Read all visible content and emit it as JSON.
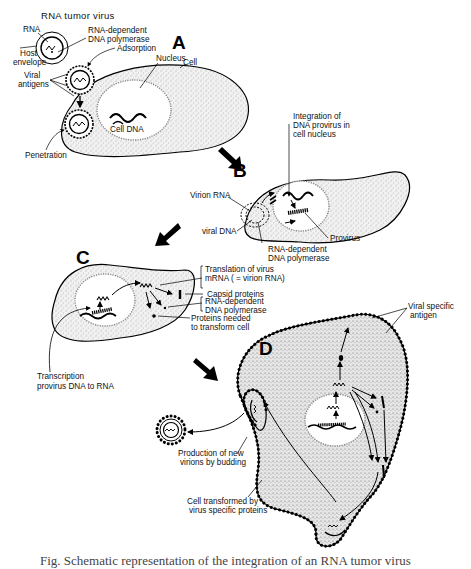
{
  "figure": {
    "panels": {
      "A": {
        "letter": "A",
        "virus_title": "RNA tumor virus",
        "labels": {
          "rna": "RNA",
          "polymerase_1": "RNA-dependent",
          "polymerase_2": "DNA polymerase",
          "host_1": "Host",
          "host_2": "envelope",
          "adsorption": "Adsorption",
          "nucleus": "Nucleus",
          "cell": "Cell",
          "antigens_1": "Viral",
          "antigens_2": "antigens",
          "cell_dna": "Cell DNA",
          "penetration": "Penetration"
        }
      },
      "B": {
        "letter": "B",
        "labels": {
          "integration_1": "Integration of",
          "integration_2": "DNA provirus in",
          "integration_3": "cell nucleus",
          "virion_rna": "Virion RNA",
          "viral_dna": "viral DNA",
          "provirus": "Provirus",
          "polymerase_1": "RNA-dependent",
          "polymerase_2": "DNA polymerase"
        }
      },
      "C": {
        "letter": "C",
        "labels": {
          "translation_1": "Translation of virus",
          "translation_2": "mRNA  ( = virion RNA)",
          "capsid": "Capsid proteins",
          "polymerase_1": "RNA-dependent",
          "polymerase_2": "DNA polymerase",
          "transform_1": "Proteins needed",
          "transform_2": "to transform cell",
          "transcription_1": "Transcription",
          "transcription_2": "provirus  DNA  to RNA"
        }
      },
      "D": {
        "letter": "D",
        "labels": {
          "antigen_1": "Viral specific",
          "antigen_2": "antigen",
          "budding_1": "Production of new",
          "budding_2": "virions by budding",
          "transformed_1": "Cell transformed by",
          "transformed_2": "virus specific proteins"
        }
      }
    },
    "caption": "Fig.  Schematic representation of the integration of an RNA tumor  virus"
  }
}
